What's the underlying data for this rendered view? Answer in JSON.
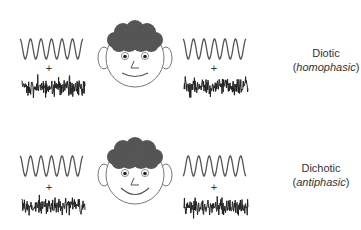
{
  "figure": {
    "rows": [
      {
        "id": "diotic",
        "title": "Diotic",
        "subtitle_open": "(",
        "subtitle": "homophasic",
        "subtitle_close": ")",
        "left_ear": {
          "tone_phase_deg": 0,
          "plus": "+"
        },
        "right_ear": {
          "tone_phase_deg": 0,
          "plus": "+"
        },
        "face_expression": "slight-smile"
      },
      {
        "id": "dichotic",
        "title": "Dichotic",
        "subtitle_open": "(",
        "subtitle": "antiphasic",
        "subtitle_close": ")",
        "left_ear": {
          "tone_phase_deg": 0,
          "plus": "+"
        },
        "right_ear": {
          "tone_phase_deg": 180,
          "plus": "+"
        },
        "face_expression": "big-smile"
      }
    ],
    "colors": {
      "line": "#555555",
      "noise": "#222222",
      "hair": "#555555",
      "text": "#333333"
    }
  }
}
